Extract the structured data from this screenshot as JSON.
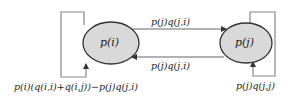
{
  "diagram": {
    "type": "state-transition",
    "colors": {
      "node_fill": "#d9d9d9",
      "node_stroke": "#333333",
      "edge": "#555555",
      "loop": "#777777",
      "text": "#222222"
    },
    "nodes": [
      {
        "id": "i",
        "label": "p(i)"
      },
      {
        "id": "j",
        "label": "p(j)"
      }
    ],
    "edges": [
      {
        "from": "i",
        "to": "j",
        "label": "p(j)q(j,i)"
      },
      {
        "from": "j",
        "to": "i",
        "label": "p(j)q(j,i)"
      },
      {
        "from": "i",
        "to": "i",
        "label": "p(i)(q(i,i)+q(i,j))−p(j)q(j,i)"
      },
      {
        "from": "j",
        "to": "j",
        "label": "p(j)q(j,j)"
      }
    ]
  }
}
